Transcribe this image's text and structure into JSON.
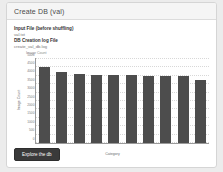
{
  "panel": {
    "title": "Create DB (val)"
  },
  "fields": [
    {
      "label": "Input File (before shuffling)",
      "value": "val.txt"
    },
    {
      "label": "DB Creation log File",
      "value": "create_val_db.log"
    }
  ],
  "actions": {
    "explore_label": "Explore the db"
  },
  "colors": {
    "bar": "#4d4d4d",
    "button": "#3a3a3a",
    "panel_header": "#f5f5f5",
    "page_background": "#ececec"
  },
  "chart_data": {
    "type": "bar",
    "title": "Image Count",
    "xlabel": "Category",
    "ylabel": "Image Count",
    "categories": [
      "1",
      "2",
      "3",
      "4",
      "5",
      "6",
      "7",
      "8",
      "9",
      "10"
    ],
    "values": [
      4500,
      4200,
      4120,
      4050,
      4040,
      4040,
      4000,
      3960,
      3960,
      3780
    ],
    "ylim": [
      0,
      5000
    ],
    "yticks": [
      0,
      500,
      1000,
      1500,
      2000,
      2500,
      3000,
      3500,
      4000,
      4500,
      5000
    ],
    "ytick_labels": [
      "0",
      "500",
      "1000",
      "1500",
      "2000",
      "2500",
      "3000",
      "3500",
      "4000",
      "4500",
      "5000"
    ],
    "grid": true,
    "legend": false
  }
}
